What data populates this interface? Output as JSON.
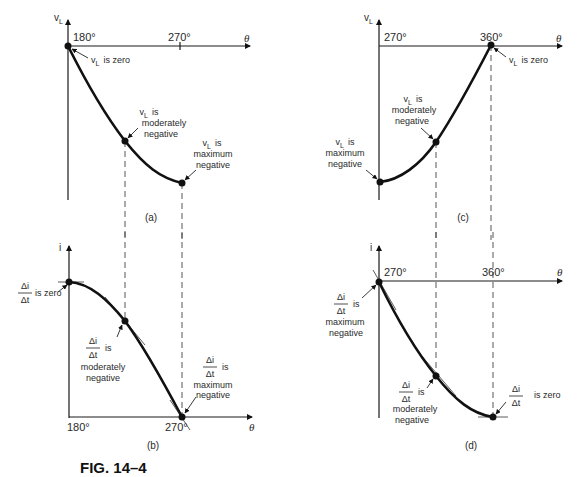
{
  "figure": {
    "caption": "FIG. 14–4",
    "theta_symbol": "θ",
    "panels": {
      "a": {
        "label": "(a)",
        "y_axis": "v",
        "y_axis_sub": "L",
        "x_ticks": [
          "180°",
          "270°"
        ],
        "annotations": [
          {
            "prefix": "v",
            "sub": "L",
            "lines": [
              "is zero"
            ]
          },
          {
            "prefix": "v",
            "sub": "L",
            "lines": [
              "is",
              "moderately",
              "negative"
            ]
          },
          {
            "prefix": "v",
            "sub": "L",
            "lines": [
              "is",
              "maximum",
              "negative"
            ]
          }
        ]
      },
      "b": {
        "label": "(b)",
        "y_axis": "i",
        "x_ticks": [
          "180°",
          "270°"
        ],
        "annotations": [
          {
            "num": "Δi",
            "den": "Δt",
            "lines": [
              "is zero"
            ]
          },
          {
            "num": "Δi",
            "den": "Δt",
            "lines": [
              "is",
              "moderately",
              "negative"
            ]
          },
          {
            "num": "Δi",
            "den": "Δt",
            "lines": [
              "is",
              "maximum",
              "negative"
            ]
          }
        ]
      },
      "c": {
        "label": "(c)",
        "y_axis": "v",
        "y_axis_sub": "L",
        "x_ticks": [
          "270°",
          "360°"
        ],
        "annotations": [
          {
            "prefix": "v",
            "sub": "L",
            "lines": [
              "is zero"
            ]
          },
          {
            "prefix": "v",
            "sub": "L",
            "lines": [
              "is",
              "moderately",
              "negative"
            ]
          },
          {
            "prefix": "v",
            "sub": "L",
            "lines": [
              "is",
              "maximum",
              "negative"
            ]
          }
        ]
      },
      "d": {
        "label": "(d)",
        "y_axis": "i",
        "x_ticks": [
          "270°",
          "360°"
        ],
        "annotations": [
          {
            "num": "Δi",
            "den": "Δt",
            "lines": [
              "is",
              "maximum",
              "negative"
            ]
          },
          {
            "num": "Δi",
            "den": "Δt",
            "lines": [
              "is",
              "moderately",
              "negative"
            ]
          },
          {
            "num": "Δi",
            "den": "Δt",
            "lines": [
              "is zero"
            ]
          }
        ]
      }
    }
  }
}
